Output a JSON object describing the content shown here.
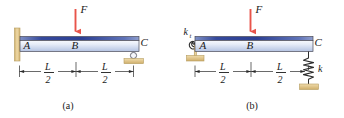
{
  "figure": {
    "type": "engineering-beam-diagram",
    "panels": [
      {
        "id": "a",
        "caption": "(a)",
        "support_left": "fixed-wall",
        "support_right": "roller",
        "points": [
          {
            "key": "A",
            "label": "A",
            "position": "left-end"
          },
          {
            "key": "B",
            "label": "B",
            "position": "midspan"
          },
          {
            "key": "C",
            "label": "C",
            "position": "right-end"
          }
        ],
        "load": {
          "label": "F",
          "direction": "down",
          "applied_at": "B"
        },
        "dimensions": [
          {
            "numerator": "L",
            "denominator": "2",
            "span": "A-B"
          },
          {
            "numerator": "L",
            "denominator": "2",
            "span": "B-C"
          }
        ],
        "springs": []
      },
      {
        "id": "b",
        "caption": "(b)",
        "support_left": "pin-with-torsional-spring",
        "support_right": "coil-spring-to-ground",
        "points": [
          {
            "key": "A",
            "label": "A",
            "position": "left-end"
          },
          {
            "key": "B",
            "label": "B",
            "position": "midspan"
          },
          {
            "key": "C",
            "label": "C",
            "position": "right-end"
          }
        ],
        "load": {
          "label": "F",
          "direction": "down",
          "applied_at": "B"
        },
        "dimensions": [
          {
            "numerator": "L",
            "denominator": "2",
            "span": "A-B"
          },
          {
            "numerator": "L",
            "denominator": "2",
            "span": "B-C"
          }
        ],
        "springs": [
          {
            "label": "k",
            "subscript": "t",
            "kind": "torsional",
            "at": "A"
          },
          {
            "label": "k",
            "subscript": "",
            "kind": "helical",
            "at": "C"
          }
        ]
      }
    ]
  },
  "colors": {
    "beam_top_dark": "#2a3f96",
    "beam_top_light": "#c9d4ee",
    "beam_body_light": "#eef2fa",
    "beam_body_mid": "#b9c6e4",
    "force_arrow": "#e8544a",
    "ground_fill": "#e3c98f",
    "ground_edge": "#b59c5e",
    "outline": "#4a4a58",
    "text": "#1a1a1a"
  }
}
